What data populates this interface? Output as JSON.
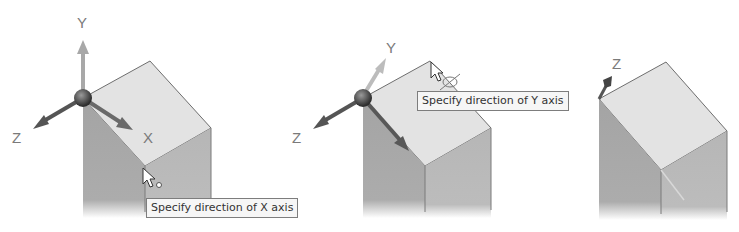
{
  "panels": [
    {
      "id": "step-1",
      "axis_labels": {
        "y": "Y",
        "z": "Z",
        "x": "X"
      },
      "tooltip": "Specify direction of X axis",
      "cursor": "arrow-cursor-with-point"
    },
    {
      "id": "step-2",
      "axis_labels": {
        "y": "Y",
        "z": "Z"
      },
      "tooltip": "Specify direction of Y axis",
      "cursor": "arrow-cursor-with-rotate"
    },
    {
      "id": "step-3",
      "axis_labels": {
        "z": "Z"
      },
      "tooltip": ""
    }
  ],
  "colors": {
    "top_face": "#e4e4e4",
    "left_face": "#a8a8a8",
    "right_face": "#b9b9b9",
    "edge": "#6e6e6e",
    "axis_dark": "#555555",
    "axis_light": "#b0b0b0",
    "tooltip_bg": "#f6f6f6"
  }
}
